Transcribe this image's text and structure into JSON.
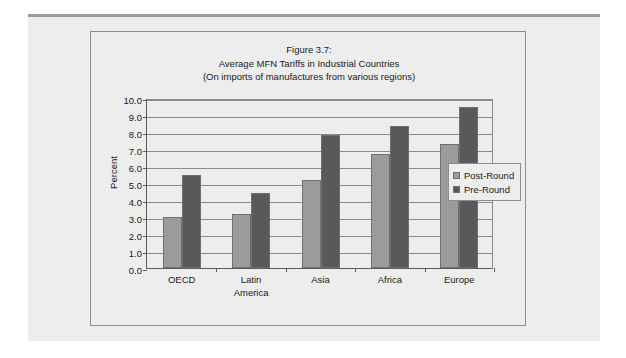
{
  "figure": {
    "frame_border_color": "#8c8c8c",
    "page_background": "#ededed"
  },
  "chart_data": {
    "type": "bar",
    "title": "Figure 3.7:",
    "title_lines": [
      "Figure 3.7:",
      "Average MFN Tariffs in Industrial Countries",
      "(On imports of manufactures from various regions)"
    ],
    "subtitle": "Average MFN Tariffs in Industrial Countries",
    "note": "(On imports of manufactures from various regions)",
    "xlabel": "America",
    "ylabel": "Percent",
    "ylim": [
      0.0,
      10.0
    ],
    "ytick_step": 1.0,
    "ytick_labels": [
      "10.0",
      "9.0",
      "8.0",
      "7.0",
      "6.0",
      "5.0",
      "4.0",
      "3.0",
      "2.0",
      "1.0",
      "0.0"
    ],
    "ytick_values": [
      10.0,
      9.0,
      8.0,
      7.0,
      6.0,
      5.0,
      4.0,
      3.0,
      2.0,
      1.0,
      0.0
    ],
    "grid": true,
    "legend_position": "right",
    "categories": [
      "OECD",
      "Latin\nAmerica",
      "Asia",
      "Africa",
      "Europe"
    ],
    "category_labels": [
      [
        "OECD"
      ],
      [
        "Latin",
        "America"
      ],
      [
        "Asia"
      ],
      [
        "Africa"
      ],
      [
        "Europe"
      ]
    ],
    "series": [
      {
        "name": "Post-Round",
        "color": "#9b9b9b",
        "values": [
          3.0,
          3.2,
          5.2,
          6.7,
          7.3
        ]
      },
      {
        "name": "Pre-Round",
        "color": "#595959",
        "values": [
          5.5,
          4.4,
          7.8,
          8.35,
          9.5
        ]
      }
    ]
  }
}
